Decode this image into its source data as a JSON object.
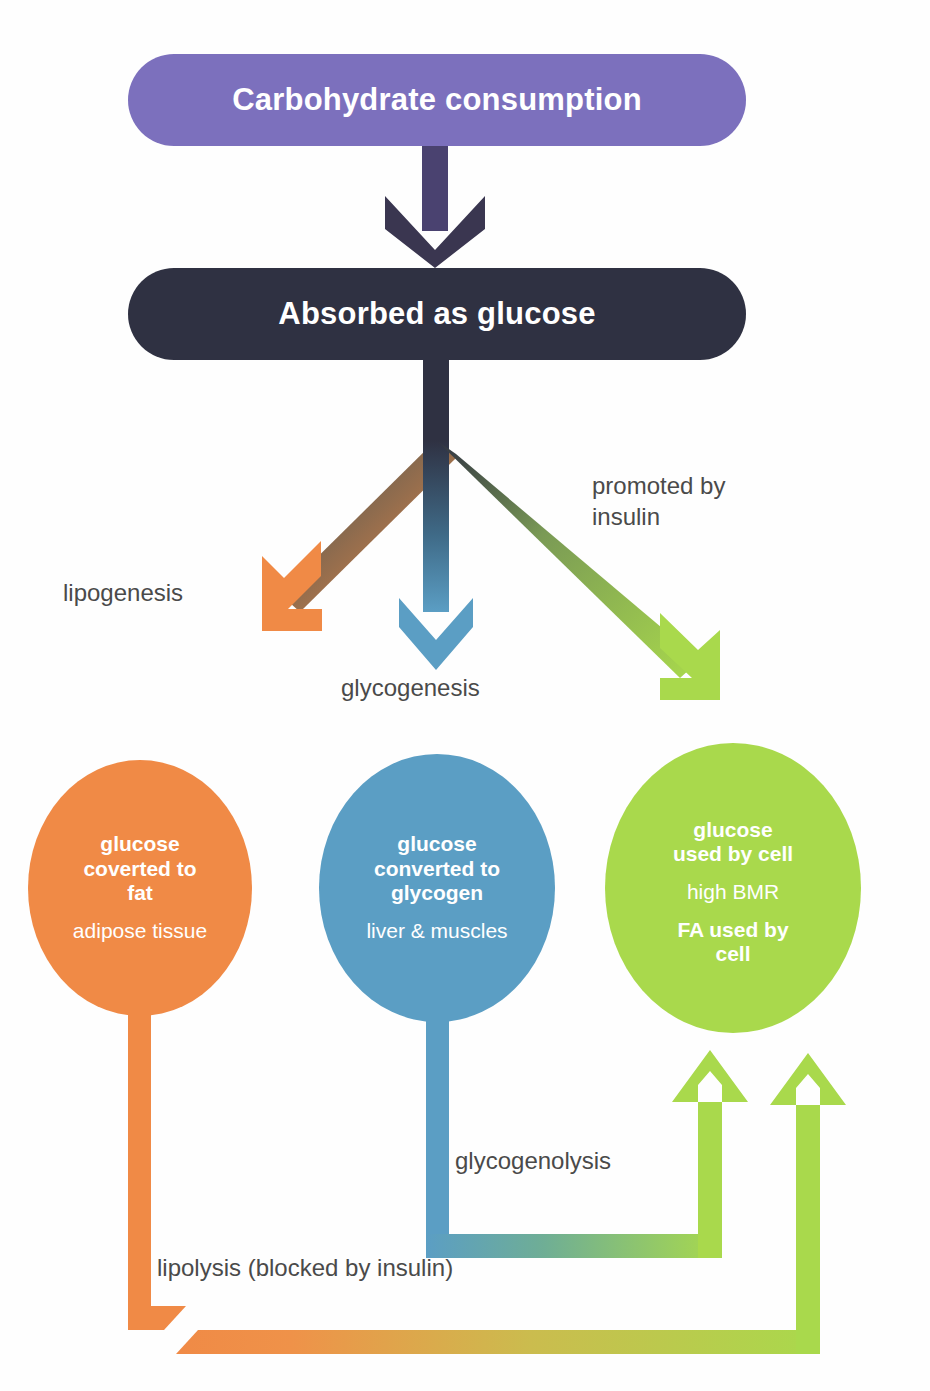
{
  "colors": {
    "purple": "#7c70bd",
    "dark": "#2f3142",
    "orange": "#f08a46",
    "blue": "#5b9ec4",
    "green": "#a9d94c",
    "label_text": "#4a4a4a",
    "node_text": "#ffffff",
    "background": "#fefefe"
  },
  "nodes": {
    "carb_box": {
      "label": "Carbohydrate consumption"
    },
    "glucose_box": {
      "label": "Absorbed as glucose"
    },
    "fat_circle": {
      "bold_lines": [
        "glucose",
        "coverted to",
        "fat"
      ],
      "regular_lines": [
        "adipose tissue"
      ]
    },
    "glycogen_circle": {
      "bold_lines": [
        "glucose",
        "converted to",
        "glycogen"
      ],
      "regular_lines": [
        "liver & muscles"
      ]
    },
    "cell_circle": {
      "bold_lines_1": [
        "glucose",
        "used by cell"
      ],
      "regular_lines": [
        "high BMR"
      ],
      "bold_lines_2": [
        "FA used by",
        "cell"
      ]
    }
  },
  "edges": {
    "lipogenesis": {
      "label": "lipogenesis"
    },
    "glycogenesis": {
      "label": "glycogenesis"
    },
    "promoted_by_insulin": {
      "label": "promoted by\ninsulin"
    },
    "glycogenolysis": {
      "label": "glycogenolysis"
    },
    "lipolysis": {
      "label": "lipolysis (blocked by insulin)"
    }
  }
}
